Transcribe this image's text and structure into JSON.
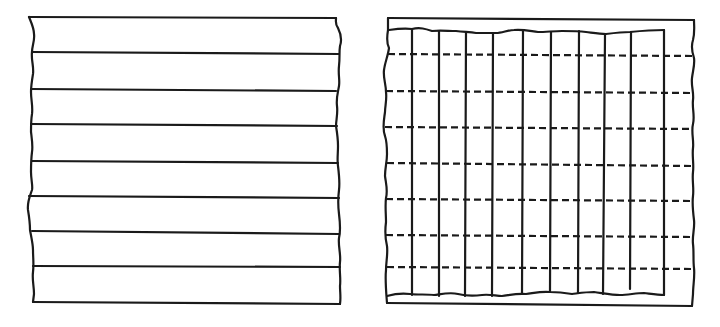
{
  "diagram": {
    "colors": {
      "stroke": "#1a1a1a",
      "background": "#ffffff"
    },
    "panels": [
      {
        "id": "left",
        "description": "Sheet with parallel horizontal solid lines (rough/torn left and right edges)",
        "horizontal_solid_lines": 7,
        "bands": 8
      },
      {
        "id": "right",
        "description": "Sheet in outer rectangle frame with vertical solid lines crossing horizontal dashed lines",
        "vertical_solid_lines": 10,
        "horizontal_dashed_lines": 7
      }
    ]
  }
}
